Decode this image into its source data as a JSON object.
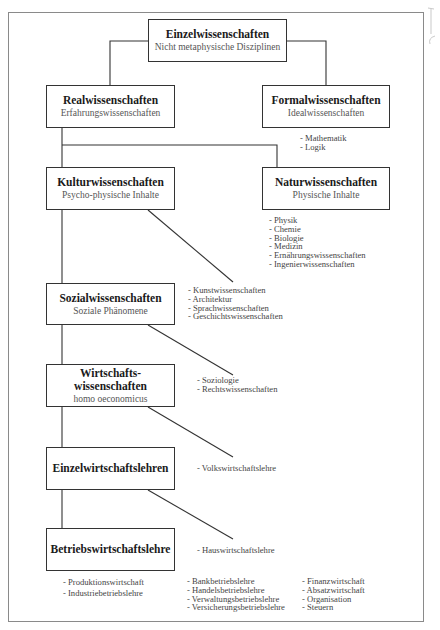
{
  "title": "Einzelwissenschaften",
  "nodes": {
    "root": {
      "title": "Einzelwissenschaften",
      "subtitle": "Nicht metaphysische Disziplinen"
    },
    "real": {
      "title": "Realwissenschaften",
      "subtitle": "Erfahrungswissenschaften"
    },
    "formal": {
      "title": "Formalwissenschaften",
      "subtitle": "Idealwissenschaften"
    },
    "kultur": {
      "title": "Kulturwissenschaften",
      "subtitle": "Psycho-physische Inhalte"
    },
    "natur": {
      "title": "Naturwissenschaften",
      "subtitle": "Physische Inhalte"
    },
    "sozial": {
      "title": "Sozialwissenschaften",
      "subtitle": "Soziale Phänomene"
    },
    "wirtschaft": {
      "title_line1": "Wirtschafts-",
      "title_line2": "wissenschaften",
      "subtitle": "homo oeconomicus"
    },
    "einzelwirt": {
      "title": "Einzelwirtschaftslehren"
    },
    "betrieb": {
      "title": "Betriebswirtschaftslehre"
    }
  },
  "lists": {
    "formal": [
      "- Mathematik",
      "- Logik"
    ],
    "natur": [
      "- Physik",
      "- Chemie",
      "- Biologie",
      "- Medizin",
      "- Ernährungswissenschaften",
      "- Ingenierwissenschaften"
    ],
    "kultur": [
      "- Kunstwissenschaften",
      "- Architektur",
      "- Sprachwissenschaften",
      "- Geschichtswissenschaften"
    ],
    "sozial": [
      "- Soziologie",
      "- Rechtswissenschaften"
    ],
    "wirtschaft": [
      "- Volkswirtschaftslehre"
    ],
    "einzelwirt": [
      "- Hauswirtschaftslehre"
    ],
    "betrieb_col1": [
      "- Produktionswirtschaft",
      "- Industriebetriebslehre"
    ],
    "betrieb_col2": [
      "- Bankbetriebslehre",
      "- Handelsbetriebslehre",
      "- Verwaltungsbetriebslehre",
      "- Versicherungsbetriebslehre"
    ],
    "betrieb_col3": [
      "- Finanzwirtschaft",
      "- Absatzwirtschaft",
      "- Organisation",
      "- Steuern"
    ]
  },
  "colors": {
    "line": "#333333",
    "frame": "#8a8a8a",
    "subtitle": "#555555"
  }
}
